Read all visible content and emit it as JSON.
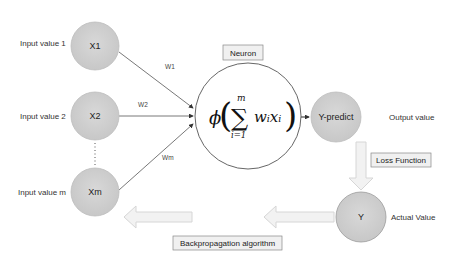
{
  "diagram": {
    "title": "Neuron",
    "inputs": [
      {
        "label": "Input value 1",
        "node": "X1",
        "weight": "W1"
      },
      {
        "label": "Input value 2",
        "node": "X2",
        "weight": "W2"
      },
      {
        "label": "Input value m",
        "node": "Xm",
        "weight": "Wm"
      }
    ],
    "ellipsis": "⋮",
    "neuron": {
      "label": "Neuron",
      "phi": "ϕ",
      "sum": "∑",
      "upper": "m",
      "lower": "i=1",
      "term": "wᵢxᵢ"
    },
    "output": {
      "node": "Y-predict",
      "label": "Output value"
    },
    "loss": {
      "label": "Loss Function"
    },
    "actual": {
      "node": "Y",
      "label": "Actual Value"
    },
    "backprop": {
      "label": "Backpropagation algorithm"
    },
    "colors": {
      "node_fill": "#d0d0d0",
      "node_stroke": "#b8b8b8",
      "line": "#444444",
      "arrow_fill": "#f2f2f2",
      "arrow_stroke": "#d8d8d8",
      "box_fill": "#f0f0f0",
      "box_stroke": "#888888"
    }
  }
}
